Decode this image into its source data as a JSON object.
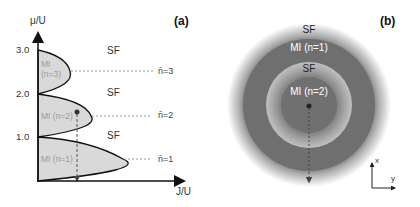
{
  "panel_a": {
    "tag": "(a)",
    "y_axis_label": "μ/U",
    "x_axis_label": "J/U",
    "y_ticks": [
      "3.0",
      "2.0",
      "1.0"
    ],
    "regions": {
      "sf_labels": [
        "SF",
        "SF",
        "SF"
      ],
      "mi_labels": [
        {
          "line1": "MI",
          "line2": "(n=3)"
        },
        {
          "line1": "MI (n=2)"
        },
        {
          "line1": "MI (n=1)"
        }
      ]
    },
    "density_labels": [
      "n̄=3",
      "n̄=2",
      "n̄=1"
    ],
    "colors": {
      "lobe_fill": "#d9d9d9",
      "axis": "#111111",
      "dashed": "#999999"
    }
  },
  "panel_b": {
    "tag": "(b)",
    "ring_labels": {
      "outer_sf": "SF",
      "mi_n1": "MI (n=1)",
      "inner_sf": "SF",
      "mi_n2": "MI (n=2)"
    },
    "axes": {
      "x": "x",
      "y": "y"
    },
    "colors": {
      "mi": "#6e6e6e",
      "sf": "#bdbdbd",
      "label_on_dark": "#ffffff",
      "label_on_light": "#222222"
    }
  }
}
